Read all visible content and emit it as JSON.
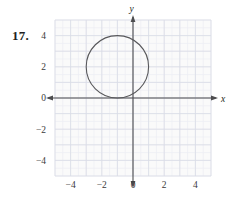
{
  "problem": {
    "number_label": "17."
  },
  "chart_data": {
    "type": "scatter",
    "title": "",
    "subtitle": "",
    "xlabel": "x",
    "ylabel": "y",
    "xlim": [
      -5,
      5
    ],
    "ylim": [
      -5,
      5
    ],
    "grid": true,
    "grid_minor_step": 0.5,
    "grid_major_step": 1,
    "legend": "none",
    "x_ticks": [
      -4,
      -2,
      0,
      2,
      4
    ],
    "y_ticks": [
      4,
      2,
      0,
      -2,
      -4
    ],
    "x_tick_labels": [
      "−4",
      "−2",
      "0",
      "2",
      "4"
    ],
    "y_tick_labels": [
      "4",
      "2",
      "0",
      "−2",
      "−4"
    ],
    "axis_arrows": [
      "left",
      "right",
      "up",
      "down"
    ],
    "shapes": [
      {
        "kind": "circle",
        "center_x": -1,
        "center_y": 2,
        "radius": 2,
        "equation": "(x + 1)^2 + (y - 2)^2 = 4",
        "stroke": "#58585b",
        "fill": "none",
        "note": "tangent to the x-axis at (-1, 0)"
      }
    ],
    "colors": {
      "axis": "#4d4d4f",
      "curve": "#58585b",
      "grid_major": "#d9dce6",
      "grid_minor": "#eceef4",
      "plot_background": "#fafafa",
      "text": "#231f20"
    }
  }
}
